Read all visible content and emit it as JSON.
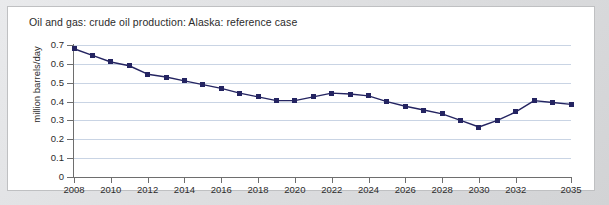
{
  "chart_data": {
    "type": "line",
    "title": "Oil and gas: crude oil production: Alaska: reference case",
    "xlabel": "",
    "ylabel": "million barrels/day",
    "ylim": [
      0,
      0.7
    ],
    "xlim": [
      2008,
      2035
    ],
    "grid": true,
    "legend": "none",
    "marker": "square",
    "series_color": "#242461",
    "grid_color": "#c9d4e4",
    "ytick_labels": [
      "0",
      "0.1",
      "0.2",
      "0.3",
      "0.4",
      "0.5",
      "0.6",
      "0.7"
    ],
    "ytick_values": [
      0,
      0.1,
      0.2,
      0.3,
      0.4,
      0.5,
      0.6,
      0.7
    ],
    "xtick_labels": [
      "2008",
      "2010",
      "2012",
      "2014",
      "2016",
      "2018",
      "2020",
      "2022",
      "2024",
      "2026",
      "2028",
      "2030",
      "2032",
      "2035"
    ],
    "xtick_values": [
      2008,
      2010,
      2012,
      2014,
      2016,
      2018,
      2020,
      2022,
      2024,
      2026,
      2028,
      2030,
      2032,
      2035
    ],
    "x": [
      2008,
      2009,
      2010,
      2011,
      2012,
      2013,
      2014,
      2015,
      2016,
      2017,
      2018,
      2019,
      2020,
      2021,
      2022,
      2023,
      2024,
      2025,
      2026,
      2027,
      2028,
      2029,
      2030,
      2031,
      2032,
      2033,
      2034,
      2035
    ],
    "values": [
      0.68,
      0.645,
      0.61,
      0.59,
      0.545,
      0.53,
      0.51,
      0.49,
      0.47,
      0.445,
      0.425,
      0.405,
      0.405,
      0.425,
      0.445,
      0.44,
      0.43,
      0.4,
      0.375,
      0.355,
      0.335,
      0.3,
      0.265,
      0.3,
      0.345,
      0.405,
      0.395,
      0.385
    ],
    "series": [
      {
        "name": "Alaska crude oil production, reference case",
        "values": [
          0.68,
          0.645,
          0.61,
          0.59,
          0.545,
          0.53,
          0.51,
          0.49,
          0.47,
          0.445,
          0.425,
          0.405,
          0.405,
          0.425,
          0.445,
          0.44,
          0.43,
          0.4,
          0.375,
          0.355,
          0.335,
          0.3,
          0.265,
          0.3,
          0.345,
          0.405,
          0.395,
          0.385
        ]
      }
    ]
  }
}
